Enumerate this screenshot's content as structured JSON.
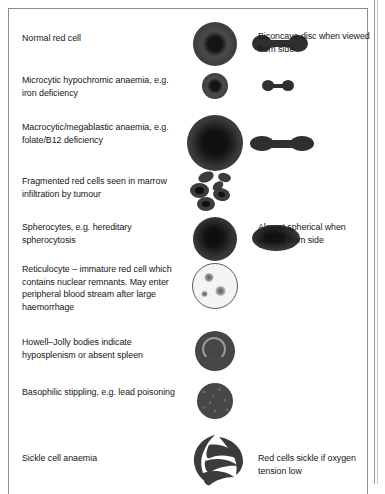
{
  "figure": {
    "rows": [
      {
        "id": "normal-red-cell",
        "description": "Normal red cell",
        "note": "Biconcave disc when viewed from side",
        "top_view_icon": "red-cell-top-view",
        "side_view_icon": "red-cell-side-view"
      },
      {
        "id": "microcytic-hypochromic",
        "description": "Microcytic hypochromic anaemia, e.g. iron deficiency",
        "note": "",
        "top_view_icon": "microcytic-cell-top-view",
        "side_view_icon": "microcytic-cell-side-view"
      },
      {
        "id": "macrocytic-megaloblastic",
        "description": "Macrocytic/megablastic anaemia, e.g. folate/B12 deficiency",
        "note": "",
        "top_view_icon": "macrocytic-cell-top-view",
        "side_view_icon": "macrocytic-cell-side-view"
      },
      {
        "id": "fragmented-red-cells",
        "description": "Fragmented red cells seen in marrow infiltration by tumour",
        "note": "",
        "top_view_icon": "fragmented-cells-cluster",
        "side_view_icon": ""
      },
      {
        "id": "spherocytes",
        "description": "Spherocytes, e.g. hereditary spherocytosis",
        "note": "Almost spherical when viewed from side",
        "top_view_icon": "spherocyte-top-view",
        "side_view_icon": "spherocyte-side-view"
      },
      {
        "id": "reticulocyte",
        "description": "Reticulocyte – immature red cell which contains nuclear remnants. May enter peripheral blood stream after large haemorrhage",
        "note": "",
        "top_view_icon": "reticulocyte-top-view",
        "side_view_icon": ""
      },
      {
        "id": "howell-jolly-bodies",
        "description": "Howell–Jolly bodies indicate hyposplenism or absent spleen",
        "note": "",
        "top_view_icon": "howell-jolly-cell-top-view",
        "side_view_icon": ""
      },
      {
        "id": "basophilic-stippling",
        "description": "Basophilic stippling, e.g. lead poisoning",
        "note": "",
        "top_view_icon": "basophilic-stippling-cell",
        "side_view_icon": ""
      },
      {
        "id": "sickle-cell-anaemia",
        "description": "Sickle cell anaemia",
        "note": "Red cells sickle if oxygen tension low",
        "top_view_icon": "sickle-cells-cluster",
        "side_view_icon": ""
      }
    ]
  },
  "colors": {
    "cell_fill": "#3a3a3a",
    "cell_core": "#121212",
    "frame_border": "#8d8d8d",
    "text": "#161616",
    "page_background": "#ffffff",
    "reticulocyte_fill": "#f4f4f4"
  }
}
